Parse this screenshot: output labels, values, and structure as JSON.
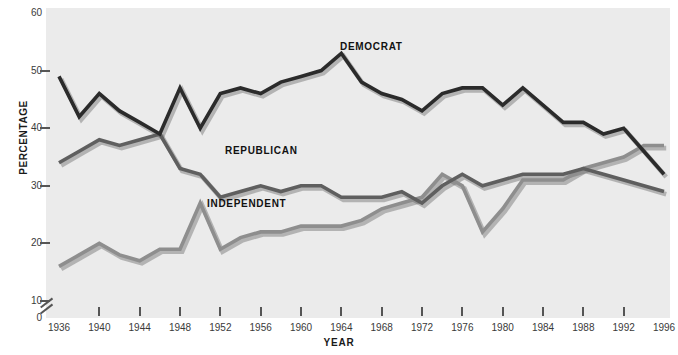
{
  "chart_data": {
    "type": "line",
    "title": "",
    "xlabel": "YEAR",
    "ylabel": "PERCENTAGE",
    "xlim": [
      1936,
      1996
    ],
    "ylim": [
      0,
      60
    ],
    "y_ticks": [
      0,
      10,
      20,
      30,
      40,
      50,
      60
    ],
    "x_ticks": [
      1936,
      1940,
      1944,
      1948,
      1952,
      1956,
      1960,
      1964,
      1968,
      1972,
      1976,
      1980,
      1984,
      1988,
      1992,
      1996
    ],
    "axis_break": "y-axis broken between 0 and 10",
    "grid": false,
    "legend": "inline labels on lines",
    "x": [
      1936,
      1938,
      1940,
      1942,
      1944,
      1946,
      1948,
      1950,
      1952,
      1954,
      1956,
      1958,
      1960,
      1962,
      1964,
      1966,
      1968,
      1970,
      1972,
      1974,
      1976,
      1978,
      1980,
      1982,
      1984,
      1986,
      1988,
      1990,
      1992,
      1994,
      1996
    ],
    "series": [
      {
        "name": "DEMOCRAT",
        "color": "#2b2b2b",
        "values": [
          49,
          42,
          46,
          43,
          41,
          39,
          47,
          40,
          46,
          47,
          46,
          48,
          49,
          50,
          53,
          48,
          46,
          45,
          43,
          46,
          47,
          47,
          44,
          47,
          44,
          41,
          41,
          39,
          40,
          36,
          32
        ]
      },
      {
        "name": "REPUBLICAN",
        "color": "#5f5f5f",
        "values": [
          34,
          36,
          38,
          37,
          38,
          39,
          33,
          32,
          28,
          29,
          30,
          29,
          30,
          30,
          28,
          28,
          28,
          29,
          27,
          30,
          32,
          30,
          31,
          32,
          32,
          32,
          33,
          32,
          31,
          30,
          29
        ]
      },
      {
        "name": "INDEPENDENT",
        "color": "#8e8e8e",
        "values": [
          16,
          18,
          20,
          18,
          17,
          19,
          19,
          27,
          19,
          21,
          22,
          22,
          23,
          23,
          23,
          24,
          26,
          27,
          28,
          32,
          30,
          22,
          26,
          31,
          31,
          31,
          33,
          34,
          35,
          37,
          37
        ]
      }
    ]
  },
  "axis_titles": {
    "x": "YEAR",
    "y": "PERCENTAGE"
  },
  "series_labels": {
    "democrat": "DEMOCRAT",
    "republican": "REPUBLICAN",
    "independent": "INDEPENDENT"
  },
  "colors": {
    "plot_background": "#ebebeb",
    "page_background": "#ffffff",
    "axis": "#555555",
    "text": "#1a1a1a"
  }
}
